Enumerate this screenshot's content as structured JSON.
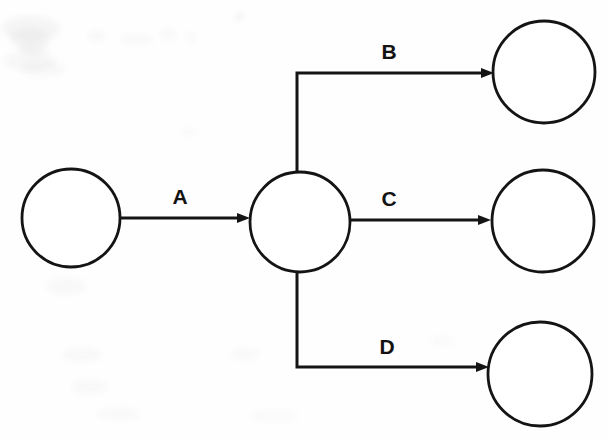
{
  "diagram": {
    "type": "directed-graph",
    "canvas": {
      "width": 608,
      "height": 441
    },
    "style": {
      "stroke_color": "#141414",
      "fill_color": "#ffffff",
      "background_color": "#fefefe",
      "node_stroke_width": 2.8,
      "edge_stroke_width": 3
    },
    "nodes": [
      {
        "id": "n1",
        "name": "source-node",
        "label": "",
        "cx": 71,
        "cy": 218,
        "r": 49
      },
      {
        "id": "n2",
        "name": "hub-node",
        "label": "",
        "cx": 300,
        "cy": 222,
        "r": 50
      },
      {
        "id": "n3",
        "name": "target-node-top",
        "label": "",
        "cx": 544,
        "cy": 72,
        "r": 51
      },
      {
        "id": "n4",
        "name": "target-node-middle",
        "label": "",
        "cx": 543,
        "cy": 221,
        "r": 51
      },
      {
        "id": "n5",
        "name": "target-node-bottom",
        "label": "",
        "cx": 540,
        "cy": 374,
        "r": 52
      }
    ],
    "edges": [
      {
        "id": "e1",
        "label": "A",
        "from": "n1",
        "to": "n2",
        "shape": "straight",
        "path": "M 121 218 L 244 218",
        "arrow_tip": {
          "x": 250,
          "y": 218
        },
        "label_pos": {
          "x": 180,
          "y": 204
        }
      },
      {
        "id": "e2",
        "label": "B",
        "from": "n2",
        "to": "n3",
        "shape": "elbow-up",
        "path": "M 297 172 L 297 73 L 487 73",
        "arrow_tip": {
          "x": 494,
          "y": 73
        },
        "label_pos": {
          "x": 389,
          "y": 59
        }
      },
      {
        "id": "e3",
        "label": "C",
        "from": "n2",
        "to": "n4",
        "shape": "straight",
        "path": "M 350 220 L 483 220",
        "arrow_tip": {
          "x": 491,
          "y": 220
        },
        "label_pos": {
          "x": 389,
          "y": 206
        }
      },
      {
        "id": "e4",
        "label": "D",
        "from": "n2",
        "to": "n5",
        "shape": "elbow-down",
        "path": "M 297 272 L 297 367 L 481 367",
        "arrow_tip": {
          "x": 489,
          "y": 367
        },
        "label_pos": {
          "x": 387,
          "y": 354
        }
      }
    ],
    "arrow_head": {
      "length": 13,
      "half_width": 5
    }
  },
  "artifacts": {
    "description": "faint scanner speckle in upper-left and lower-left of page",
    "smudges": [
      {
        "x": 2,
        "y": 16,
        "w": 58,
        "h": 26,
        "opacity": 0.05
      },
      {
        "x": 10,
        "y": 28,
        "w": 40,
        "h": 22,
        "opacity": 0.045
      },
      {
        "x": 18,
        "y": 42,
        "w": 30,
        "h": 14,
        "opacity": 0.04
      },
      {
        "x": 4,
        "y": 52,
        "w": 52,
        "h": 18,
        "opacity": 0.045
      },
      {
        "x": 20,
        "y": 62,
        "w": 46,
        "h": 14,
        "opacity": 0.035
      },
      {
        "x": 88,
        "y": 30,
        "w": 18,
        "h": 12,
        "opacity": 0.03
      },
      {
        "x": 120,
        "y": 34,
        "w": 34,
        "h": 10,
        "opacity": 0.03
      },
      {
        "x": 160,
        "y": 28,
        "w": 16,
        "h": 12,
        "opacity": 0.03
      },
      {
        "x": 186,
        "y": 32,
        "w": 10,
        "h": 10,
        "opacity": 0.03
      },
      {
        "x": 46,
        "y": 278,
        "w": 40,
        "h": 16,
        "opacity": 0.035
      },
      {
        "x": 62,
        "y": 348,
        "w": 40,
        "h": 14,
        "opacity": 0.03
      },
      {
        "x": 72,
        "y": 380,
        "w": 36,
        "h": 14,
        "opacity": 0.03
      },
      {
        "x": 96,
        "y": 408,
        "w": 44,
        "h": 12,
        "opacity": 0.028
      },
      {
        "x": 230,
        "y": 348,
        "w": 30,
        "h": 12,
        "opacity": 0.028
      },
      {
        "x": 250,
        "y": 410,
        "w": 48,
        "h": 12,
        "opacity": 0.025
      },
      {
        "x": 430,
        "y": 336,
        "w": 24,
        "h": 10,
        "opacity": 0.025
      },
      {
        "x": 180,
        "y": 128,
        "w": 18,
        "h": 8,
        "opacity": 0.022
      },
      {
        "x": 236,
        "y": 14,
        "w": 6,
        "h": 6,
        "opacity": 0.12
      }
    ]
  }
}
